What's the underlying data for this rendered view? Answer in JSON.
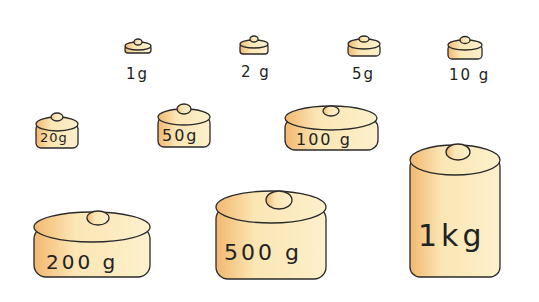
{
  "weights": [
    {
      "label": "1g"
    },
    {
      "label": "2 g"
    },
    {
      "label": "5g"
    },
    {
      "label": "10 g"
    },
    {
      "label": "20g"
    },
    {
      "label": "50g"
    },
    {
      "label": "100 g"
    },
    {
      "label": "200 g"
    },
    {
      "label": "500 g"
    },
    {
      "label": "1kg"
    }
  ],
  "colors": {
    "body": "#fbe6b4",
    "shade": "#f2b870",
    "outline": "#2a2a2a"
  }
}
